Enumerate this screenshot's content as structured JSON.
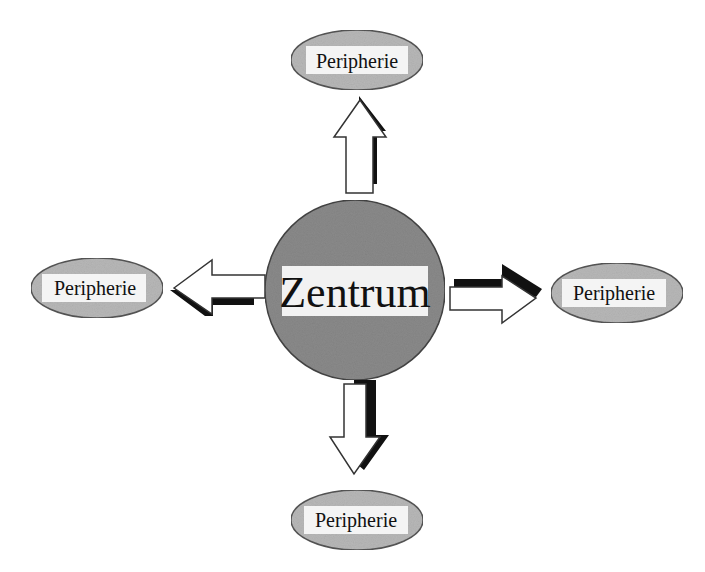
{
  "diagram": {
    "type": "hub-and-spoke",
    "center": {
      "label": "Zentrum",
      "fill": "#8a8a8a",
      "label_bg": "#f2f2f2"
    },
    "nodes": [
      {
        "id": "top",
        "label": "Peripherie",
        "direction": "up"
      },
      {
        "id": "left",
        "label": "Peripherie",
        "direction": "left"
      },
      {
        "id": "right",
        "label": "Peripherie",
        "direction": "right"
      },
      {
        "id": "bottom",
        "label": "Peripherie",
        "direction": "down"
      }
    ],
    "colors": {
      "ellipse_fill": "#b8b8b8",
      "ellipse_stroke": "#555555",
      "arrow_fill": "#ffffff",
      "arrow_shadow": "#111111"
    }
  }
}
